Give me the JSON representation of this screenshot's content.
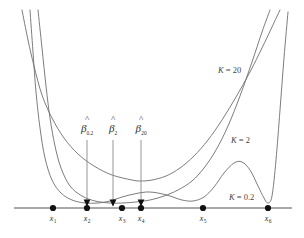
{
  "figure": {
    "background": "#ffffff",
    "curve_color": "#6e6e6e",
    "axis_color": "#8d8d8d",
    "marker_color": "#111111",
    "width": 304,
    "height": 238
  },
  "curve_labels": [
    {
      "name": "k-20",
      "text": "K = 20",
      "k_italic": "K",
      "k_value": "20",
      "x": 218,
      "y": 66
    },
    {
      "name": "k-2",
      "text": "K = 2",
      "k_italic": "K",
      "k_value": "2",
      "x": 231,
      "y": 136
    },
    {
      "name": "k-0.2",
      "text": "K = 0.2",
      "k_italic": "K",
      "k_value": "0.2",
      "x": 229,
      "y": 193
    }
  ],
  "beta_labels": [
    {
      "name": "beta-hat-0.2",
      "hat": "^",
      "symbol": "β",
      "subscript": "0.2",
      "x": 87,
      "y": 126,
      "line_to_y": 206
    },
    {
      "name": "beta-hat-2",
      "hat": "^",
      "symbol": "β",
      "subscript": "2",
      "x": 113,
      "y": 126,
      "line_to_y": 206
    },
    {
      "name": "beta-hat-20",
      "hat": "^",
      "symbol": "β",
      "subscript": "20",
      "x": 141,
      "y": 126,
      "line_to_y": 206
    }
  ],
  "axis": {
    "name": "x-axis",
    "y": 208,
    "x_start": 14,
    "x_end": 292
  },
  "data_points": [
    {
      "name": "x1",
      "label": "x",
      "subscript": "1",
      "x": 53,
      "y": 208
    },
    {
      "name": "x2",
      "label": "x",
      "subscript": "2",
      "x": 87,
      "y": 208
    },
    {
      "name": "x3",
      "label": "x",
      "subscript": "3",
      "x": 122,
      "y": 208
    },
    {
      "name": "x4",
      "label": "x",
      "subscript": "4",
      "x": 141,
      "y": 208
    },
    {
      "name": "x5",
      "label": "x",
      "subscript": "5",
      "x": 203,
      "y": 208
    },
    {
      "name": "x6",
      "label": "x",
      "subscript": "6",
      "x": 268,
      "y": 208
    }
  ],
  "chart_data": {
    "type": "line",
    "xlabel": "",
    "ylabel": "",
    "grid": false,
    "legend": "inline-annotations",
    "xlim": [
      14,
      292
    ],
    "ylim_pixels": [
      208,
      10
    ],
    "series": [
      {
        "name": "K = 20",
        "color": "#6e6e6e",
        "minimum_at": 141,
        "points": [
          [
            22,
            10
          ],
          [
            28,
            40
          ],
          [
            34,
            66
          ],
          [
            42,
            95
          ],
          [
            52,
            118
          ],
          [
            64,
            138
          ],
          [
            78,
            154
          ],
          [
            94,
            166
          ],
          [
            112,
            175
          ],
          [
            132,
            180
          ],
          [
            141,
            181
          ],
          [
            152,
            180
          ],
          [
            166,
            176
          ],
          [
            180,
            168
          ],
          [
            194,
            156
          ],
          [
            208,
            140
          ],
          [
            222,
            120
          ],
          [
            236,
            97
          ],
          [
            250,
            72
          ],
          [
            262,
            48
          ],
          [
            272,
            27
          ],
          [
            280,
            10
          ]
        ]
      },
      {
        "name": "K = 2",
        "color": "#6e6e6e",
        "minimum_at": 113,
        "points": [
          [
            38,
            10
          ],
          [
            42,
            48
          ],
          [
            46,
            86
          ],
          [
            50,
            118
          ],
          [
            55,
            146
          ],
          [
            61,
            168
          ],
          [
            70,
            186
          ],
          [
            82,
            196
          ],
          [
            95,
            201
          ],
          [
            110,
            203
          ],
          [
            122,
            203
          ],
          [
            136,
            202
          ],
          [
            150,
            200
          ],
          [
            164,
            196
          ],
          [
            178,
            190
          ],
          [
            192,
            181
          ],
          [
            204,
            168
          ],
          [
            216,
            150
          ],
          [
            228,
            126
          ],
          [
            240,
            96
          ],
          [
            252,
            62
          ],
          [
            262,
            32
          ],
          [
            270,
            10
          ]
        ]
      },
      {
        "name": "K = 0.2",
        "color": "#6e6e6e",
        "minimum_at": 87,
        "points": [
          [
            30,
            10
          ],
          [
            33,
            52
          ],
          [
            36,
            92
          ],
          [
            40,
            128
          ],
          [
            45,
            158
          ],
          [
            52,
            180
          ],
          [
            61,
            193
          ],
          [
            72,
            200
          ],
          [
            85,
            203
          ],
          [
            98,
            203
          ],
          [
            110,
            201
          ],
          [
            122,
            197
          ],
          [
            134,
            194
          ],
          [
            146,
            192
          ],
          [
            158,
            193
          ],
          [
            170,
            196
          ],
          [
            182,
            200
          ],
          [
            193,
            201
          ],
          [
            204,
            197
          ],
          [
            214,
            187
          ],
          [
            224,
            173
          ],
          [
            234,
            163
          ],
          [
            242,
            162
          ],
          [
            250,
            170
          ],
          [
            258,
            186
          ],
          [
            264,
            198
          ],
          [
            268,
            203
          ],
          [
            272,
            196
          ],
          [
            276,
            160
          ],
          [
            280,
            110
          ],
          [
            284,
            58
          ],
          [
            288,
            12
          ]
        ]
      }
    ]
  }
}
